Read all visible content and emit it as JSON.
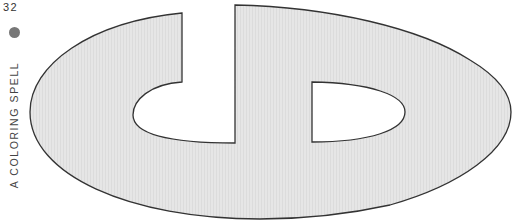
{
  "page": {
    "number": "32",
    "running_head": "A COLORING SPELL",
    "bullet": "gray-dot",
    "figure": {
      "description": "Outline coloring shape: large horizontal ellipse with 'cd' letterform cut-outs",
      "fill_color": "#e4e4e4",
      "stroke_color": "#333333",
      "background_color": "#ffffff"
    }
  }
}
